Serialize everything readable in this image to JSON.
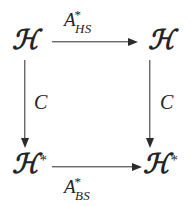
{
  "diagram": {
    "type": "commutative-square",
    "background_color": "#ffffff",
    "ink_color": "#242424",
    "nodes": {
      "top_left": {
        "symbol": "ℋ",
        "star": "",
        "name": "H"
      },
      "top_right": {
        "symbol": "ℋ",
        "star": "",
        "name": "H"
      },
      "bottom_left": {
        "symbol": "ℋ",
        "star": "*",
        "name": "H-star"
      },
      "bottom_right": {
        "symbol": "ℋ",
        "star": "*",
        "name": "H-star"
      }
    },
    "arrows": {
      "top": {
        "direction": "right",
        "label_main": "A",
        "label_sup": "*",
        "label_sub": "HS"
      },
      "bottom": {
        "direction": "right",
        "label_main": "A",
        "label_sup": "*",
        "label_sub": "BS"
      },
      "left": {
        "direction": "down",
        "label": "C"
      },
      "right": {
        "direction": "down",
        "label": "C"
      }
    }
  }
}
